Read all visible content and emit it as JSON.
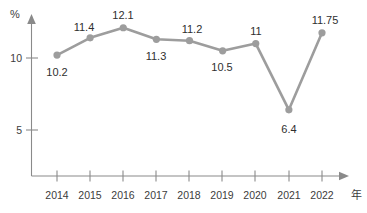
{
  "chart_data": {
    "type": "line",
    "title": "",
    "xlabel": "年",
    "ylabel": "%",
    "categories": [
      "2014",
      "2015",
      "2016",
      "2017",
      "2018",
      "2019",
      "2020",
      "2021",
      "2022"
    ],
    "values": [
      10.2,
      11.4,
      12.1,
      11.3,
      11.2,
      10.5,
      11,
      6.4,
      11.75
    ],
    "value_labels": [
      "10.2",
      "11.4",
      "12.1",
      "11.3",
      "11.2",
      "10.5",
      "11",
      "6.4",
      "11.75"
    ],
    "y_ticks": [
      "5",
      "10"
    ],
    "y_tick_values": [
      5,
      10
    ],
    "ylim": [
      0,
      13.2
    ],
    "grid": false,
    "legend": null,
    "series_color": "#9d9d9d",
    "axis_color": "#8a8a8a",
    "background": "#ffffff"
  },
  "axis": {
    "y_unit_label": "%",
    "x_unit_label": "年"
  }
}
